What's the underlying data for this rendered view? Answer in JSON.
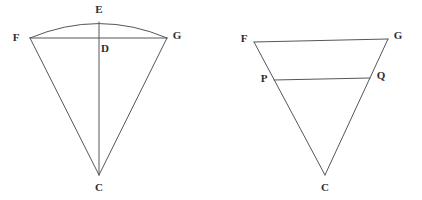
{
  "canvas": {
    "width": 422,
    "height": 200,
    "background": "#ffffff",
    "stroke_color": "#55565a",
    "label_color": "#2d2d30",
    "stroke_width": 1
  },
  "figures": [
    {
      "id": "left-figure",
      "name": "circular-sector-with-chord",
      "description": "Circular sector C-F-G with arc FEG, chord FG through D, and radius CE passing through D",
      "points": {
        "F": {
          "x": 30,
          "y": 38,
          "label": "F",
          "label_x": 16,
          "label_y": 38
        },
        "G": {
          "x": 167,
          "y": 38,
          "label": "G",
          "label_x": 177,
          "label_y": 36
        },
        "E": {
          "x": 99,
          "y": 22,
          "label": "E",
          "label_x": 99,
          "label_y": 10
        },
        "D": {
          "x": 99,
          "y": 38,
          "label": "D",
          "label_x": 104,
          "label_y": 48
        },
        "C": {
          "x": 99,
          "y": 175,
          "label": "C",
          "label_x": 99,
          "label_y": 188
        }
      },
      "segments": [
        {
          "name": "chord-FG",
          "from": "F",
          "to": "G"
        },
        {
          "name": "radius-CF",
          "from": "C",
          "to": "F"
        },
        {
          "name": "radius-CG",
          "from": "C",
          "to": "G"
        },
        {
          "name": "radius-CE",
          "from": "C",
          "to": "E"
        }
      ],
      "arcs": [
        {
          "name": "arc-FEG",
          "from": "F",
          "apex": "E",
          "to": "G"
        }
      ]
    },
    {
      "id": "right-figure",
      "name": "triangle-with-midline",
      "description": "Triangle C-F-G with segment PQ parallel to FG",
      "points": {
        "F": {
          "x": 254,
          "y": 42,
          "label": "F",
          "label_x": 244,
          "label_y": 39
        },
        "G": {
          "x": 388,
          "y": 39,
          "label": "G",
          "label_x": 398,
          "label_y": 36
        },
        "P": {
          "x": 274,
          "y": 80,
          "label": "P",
          "label_x": 264,
          "label_y": 79
        },
        "Q": {
          "x": 370,
          "y": 78,
          "label": "Q",
          "label_x": 380,
          "label_y": 76
        },
        "C": {
          "x": 325,
          "y": 175,
          "label": "C",
          "label_x": 325,
          "label_y": 188
        }
      },
      "segments": [
        {
          "name": "side-FG",
          "from": "F",
          "to": "G"
        },
        {
          "name": "side-FC",
          "from": "F",
          "to": "C"
        },
        {
          "name": "side-GC",
          "from": "G",
          "to": "C"
        },
        {
          "name": "midline-PQ",
          "from": "P",
          "to": "Q"
        }
      ],
      "arcs": []
    }
  ],
  "labels": {
    "left_F": "F",
    "left_G": "G",
    "left_E": "E",
    "left_D": "D",
    "left_C": "C",
    "right_F": "F",
    "right_G": "G",
    "right_P": "P",
    "right_Q": "Q",
    "right_C": "C"
  }
}
